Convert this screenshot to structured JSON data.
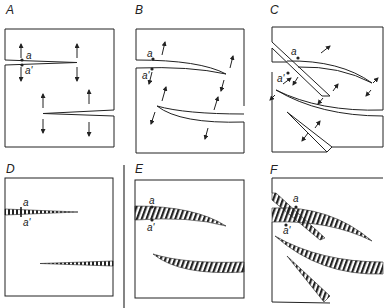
{
  "figure": {
    "panels": [
      {
        "id": "A",
        "label": "A",
        "point_top": "a",
        "point_bottom": "a'",
        "style": "crack outlines with displacement arrows"
      },
      {
        "id": "B",
        "label": "B",
        "point_top": "a",
        "point_bottom": "a'",
        "style": "curved cracks with oblique displacement arrows"
      },
      {
        "id": "C",
        "label": "C",
        "point_top": "a",
        "point_bottom": "a'",
        "style": "curved and branching cracks with arrows"
      },
      {
        "id": "D",
        "label": "D",
        "point_top": "a",
        "point_bottom": "a'",
        "style": "hatched straight veins"
      },
      {
        "id": "E",
        "label": "E",
        "point_top": "a",
        "point_bottom": "a'",
        "style": "hatched curved veins"
      },
      {
        "id": "F",
        "label": "F",
        "point_top": "a",
        "point_bottom": "a'",
        "style": "hatched branching veins"
      }
    ],
    "colors": {
      "ink": "#222222",
      "background": "#ffffff"
    }
  }
}
